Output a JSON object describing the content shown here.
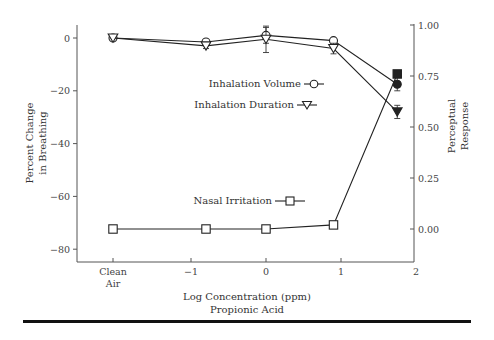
{
  "chart_data": {
    "type": "line",
    "title": "",
    "xlabel": [
      "Log Concentration (ppm)",
      "Propionic Acid"
    ],
    "ylabel_left": [
      "Percent Change",
      "in Breathing"
    ],
    "ylabel_right": [
      "Perceptual",
      "Response"
    ],
    "x_tick_labels": [
      "Clean Air",
      "−1",
      "0",
      "1",
      "2"
    ],
    "x_tick_values": [
      "clean",
      -1,
      0,
      1,
      2
    ],
    "y_left_ticks": [
      "0",
      "−20",
      "−40",
      "−60",
      "−80"
    ],
    "y_left_range": [
      -85,
      5
    ],
    "y_right_ticks": [
      "1.00",
      "0.75",
      "0.50",
      "0.25",
      "0.00"
    ],
    "y_right_range": [
      -0.13,
      1.02
    ],
    "grid": false,
    "x": [
      "Clean Air",
      -0.8,
      0.0,
      0.9,
      1.75
    ],
    "series": [
      {
        "name": "Inhalation Volume",
        "axis": "left",
        "marker": "circle",
        "values": [
          0,
          -1.5,
          1,
          -1,
          -17.5
        ],
        "filled_last": true,
        "error": [
          0,
          1,
          3,
          0,
          2.5
        ]
      },
      {
        "name": "Inhalation Duration",
        "axis": "left",
        "marker": "triangle-down",
        "values": [
          0,
          -3,
          -0.5,
          -4,
          -28
        ],
        "filled_last": true,
        "error": [
          0,
          1,
          5,
          2,
          2.5
        ]
      },
      {
        "name": "Nasal Irritation",
        "axis": "right",
        "marker": "square",
        "values": [
          0,
          0,
          0,
          0.02,
          0.76
        ],
        "filled_last": true,
        "error": [
          0,
          0,
          0,
          0,
          0
        ]
      }
    ],
    "legend": [
      {
        "label": "Inhalation Volume",
        "marker": "circle"
      },
      {
        "label": "Inhalation Duration",
        "marker": "triangle-down"
      },
      {
        "label": "Nasal Irritation",
        "marker": "square"
      }
    ]
  }
}
